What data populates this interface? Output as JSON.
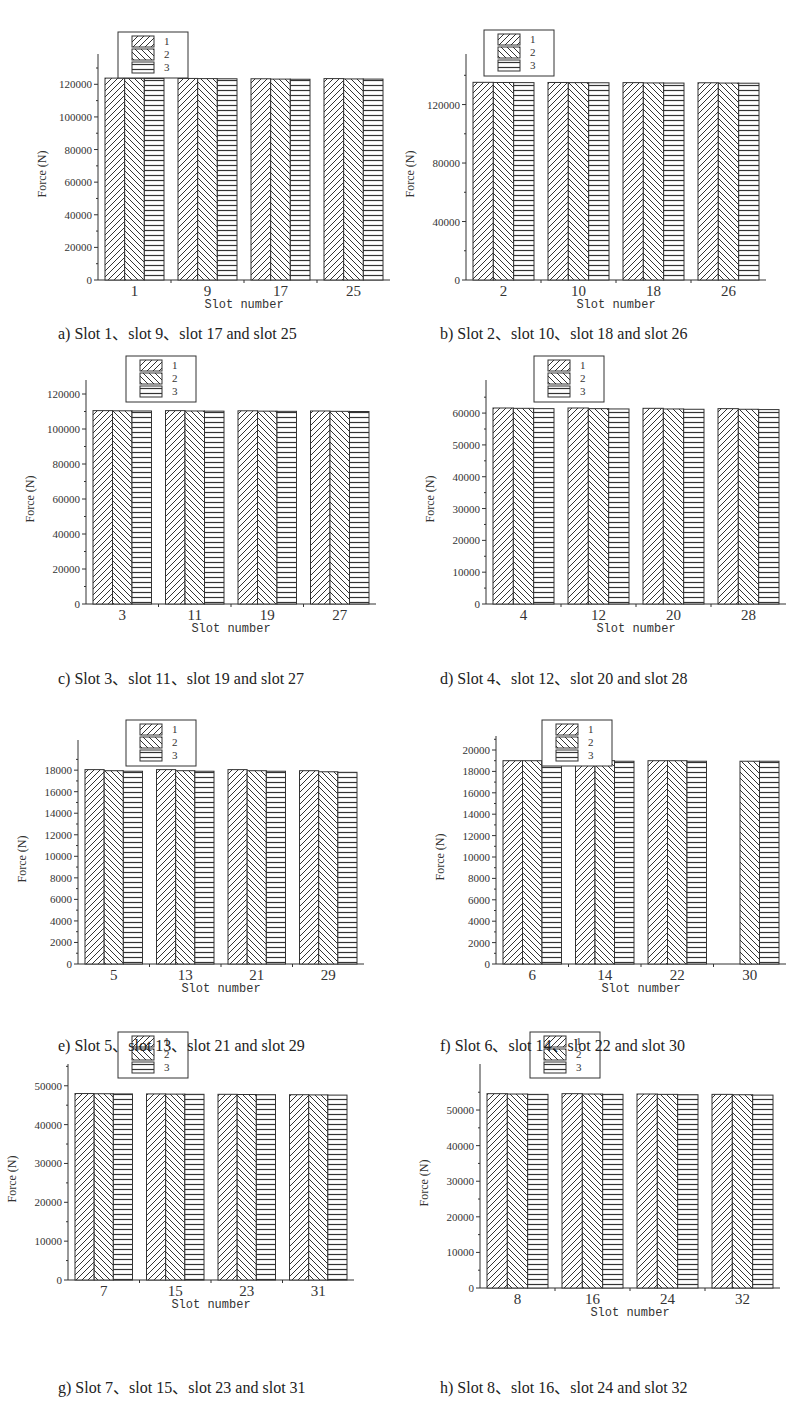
{
  "figure": {
    "legend_labels": [
      "1",
      "2",
      "3"
    ],
    "xlabel": "Slot number",
    "ylabel": "Force (N)"
  },
  "chart_data": [
    {
      "id": "a",
      "type": "bar",
      "title": "a) Slot 1、slot 9、slot 17 and slot 25",
      "categories": [
        "1",
        "9",
        "17",
        "25"
      ],
      "xlabel": "Slot number",
      "ylabel": "Force (N)",
      "ylim": [
        0,
        130000
      ],
      "yticks": [
        0,
        20000,
        40000,
        60000,
        80000,
        100000,
        120000
      ],
      "series": [
        {
          "name": "1",
          "values": [
            123800,
            123600,
            123400,
            123500
          ]
        },
        {
          "name": "2",
          "values": [
            123700,
            123500,
            123200,
            123300
          ]
        },
        {
          "name": "3",
          "values": [
            123600,
            123400,
            123100,
            123200
          ]
        }
      ]
    },
    {
      "id": "b",
      "type": "bar",
      "title": "b) Slot 2、slot 10、slot 18 and slot 26",
      "categories": [
        "2",
        "10",
        "18",
        "26"
      ],
      "xlabel": "Slot number",
      "ylabel": "Force (N)",
      "ylim": [
        0,
        145000
      ],
      "yticks": [
        0,
        40000,
        80000,
        120000
      ],
      "series": [
        {
          "name": "1",
          "values": [
            135200,
            135100,
            135000,
            134900
          ]
        },
        {
          "name": "2",
          "values": [
            135100,
            135000,
            134800,
            134700
          ]
        },
        {
          "name": "3",
          "values": [
            135000,
            134900,
            134700,
            134600
          ]
        }
      ]
    },
    {
      "id": "c",
      "type": "bar",
      "title": "c) Slot 3、slot 11、slot 19 and slot 27",
      "categories": [
        "3",
        "11",
        "19",
        "27"
      ],
      "xlabel": "Slot number",
      "ylabel": "Force (N)",
      "ylim": [
        0,
        120000
      ],
      "yticks": [
        0,
        20000,
        40000,
        60000,
        80000,
        100000,
        120000
      ],
      "series": [
        {
          "name": "1",
          "values": [
            110500,
            110500,
            110400,
            110300
          ]
        },
        {
          "name": "2",
          "values": [
            110400,
            110300,
            110200,
            110100
          ]
        },
        {
          "name": "3",
          "values": [
            110300,
            110200,
            110100,
            110000
          ]
        }
      ]
    },
    {
      "id": "d",
      "type": "bar",
      "title": "d) Slot 4、slot 12、slot 20 and slot 28",
      "categories": [
        "4",
        "12",
        "20",
        "28"
      ],
      "xlabel": "Slot number",
      "ylabel": "Force (N)",
      "ylim": [
        0,
        66000
      ],
      "yticks": [
        0,
        10000,
        20000,
        30000,
        40000,
        50000,
        60000
      ],
      "series": [
        {
          "name": "1",
          "values": [
            61600,
            61600,
            61500,
            61400
          ]
        },
        {
          "name": "2",
          "values": [
            61500,
            61400,
            61300,
            61200
          ]
        },
        {
          "name": "3",
          "values": [
            61400,
            61300,
            61200,
            61100
          ]
        }
      ]
    },
    {
      "id": "e",
      "type": "bar",
      "title": "e) Slot 5、slot 13、slot 21 and slot 29",
      "categories": [
        "5",
        "13",
        "21",
        "29"
      ],
      "xlabel": "Slot number",
      "ylabel": "Force (N)",
      "ylim": [
        0,
        19500
      ],
      "yticks": [
        0,
        2000,
        4000,
        6000,
        8000,
        10000,
        12000,
        14000,
        16000,
        18000
      ],
      "series": [
        {
          "name": "1",
          "values": [
            18050,
            18050,
            18050,
            17950
          ]
        },
        {
          "name": "2",
          "values": [
            17950,
            17950,
            17950,
            17850
          ]
        },
        {
          "name": "3",
          "values": [
            17900,
            17900,
            17900,
            17800
          ]
        }
      ]
    },
    {
      "id": "f",
      "type": "bar",
      "title": "f) Slot 6、slot 14、slot 22 and slot 30",
      "categories": [
        "6",
        "14",
        "22",
        "30"
      ],
      "xlabel": "Slot number",
      "ylabel": "Force (N)",
      "ylim": [
        0,
        20000
      ],
      "yticks": [
        0,
        2000,
        4000,
        6000,
        8000,
        10000,
        12000,
        14000,
        16000,
        18000,
        20000
      ],
      "series": [
        {
          "name": "1",
          "values": [
            19000,
            19000,
            19000,
            null
          ]
        },
        {
          "name": "2",
          "values": [
            19000,
            19000,
            19000,
            18950
          ]
        },
        {
          "name": "3",
          "values": [
            18950,
            18950,
            18950,
            18950
          ]
        }
      ]
    },
    {
      "id": "g",
      "type": "bar",
      "title": "g) Slot 7、slot 15、slot 23 and slot 31",
      "categories": [
        "7",
        "15",
        "23",
        "31"
      ],
      "xlabel": "Slot number",
      "ylabel": "Force (N)",
      "ylim": [
        0,
        52000
      ],
      "yticks": [
        0,
        10000,
        20000,
        30000,
        40000,
        50000
      ],
      "series": [
        {
          "name": "1",
          "values": [
            48000,
            47900,
            47800,
            47700
          ]
        },
        {
          "name": "2",
          "values": [
            47950,
            47850,
            47750,
            47650
          ]
        },
        {
          "name": "3",
          "values": [
            47900,
            47800,
            47700,
            47600
          ]
        }
      ]
    },
    {
      "id": "h",
      "type": "bar",
      "title": "h) Slot 8、slot 16、slot 24 and slot 32",
      "categories": [
        "8",
        "16",
        "24",
        "32"
      ],
      "xlabel": "Slot number",
      "ylabel": "Force (N)",
      "ylim": [
        0,
        59000
      ],
      "yticks": [
        0,
        10000,
        20000,
        30000,
        40000,
        50000
      ],
      "series": [
        {
          "name": "1",
          "values": [
            54600,
            54600,
            54500,
            54400
          ]
        },
        {
          "name": "2",
          "values": [
            54500,
            54500,
            54400,
            54300
          ]
        },
        {
          "name": "3",
          "values": [
            54400,
            54400,
            54300,
            54200
          ]
        }
      ]
    }
  ],
  "layout": [
    {
      "x": 30,
      "y": 28,
      "w": 370,
      "h": 275,
      "plot": {
        "l": 68,
        "t": 40,
        "w": 292,
        "h": 212
      },
      "legend": {
        "x": 88,
        "y": 4
      },
      "cap": {
        "x": 58,
        "y": 320
      }
    },
    {
      "x": 400,
      "y": 28,
      "w": 370,
      "h": 275,
      "plot": {
        "l": 66,
        "t": 40,
        "w": 300,
        "h": 212
      },
      "legend": {
        "x": 84,
        "y": 2
      },
      "cap": {
        "x": 440,
        "y": 320
      }
    },
    {
      "x": 30,
      "y": 370,
      "w": 370,
      "h": 275,
      "plot": {
        "l": 56,
        "t": 24,
        "w": 290,
        "h": 210
      },
      "legend": {
        "x": 96,
        "y": -14
      },
      "cap": {
        "x": 58,
        "y": 665
      }
    },
    {
      "x": 400,
      "y": 370,
      "w": 370,
      "h": 275,
      "plot": {
        "l": 86,
        "t": 24,
        "w": 300,
        "h": 210
      },
      "legend": {
        "x": 134,
        "y": -14
      },
      "cap": {
        "x": 440,
        "y": 665
      }
    },
    {
      "x": 30,
      "y": 720,
      "w": 370,
      "h": 275,
      "plot": {
        "l": 48,
        "t": 34,
        "w": 286,
        "h": 210
      },
      "legend": {
        "x": 96,
        "y": 0
      },
      "cap": {
        "x": 58,
        "y": 1032
      }
    },
    {
      "x": 400,
      "y": 720,
      "w": 370,
      "h": 275,
      "plot": {
        "l": 96,
        "t": 30,
        "w": 290,
        "h": 214
      },
      "legend": {
        "x": 142,
        "y": 0
      },
      "cap": {
        "x": 440,
        "y": 1032
      }
    },
    {
      "x": 30,
      "y": 1062,
      "w": 370,
      "h": 275,
      "plot": {
        "l": 38,
        "t": 16,
        "w": 286,
        "h": 202
      },
      "legend": {
        "x": 88,
        "y": -30
      },
      "cap": {
        "x": 58,
        "y": 1374
      }
    },
    {
      "x": 400,
      "y": 1062,
      "w": 370,
      "h": 275,
      "plot": {
        "l": 80,
        "t": 16,
        "w": 300,
        "h": 210
      },
      "legend": {
        "x": 130,
        "y": -30
      },
      "cap": {
        "x": 440,
        "y": 1374
      }
    }
  ]
}
